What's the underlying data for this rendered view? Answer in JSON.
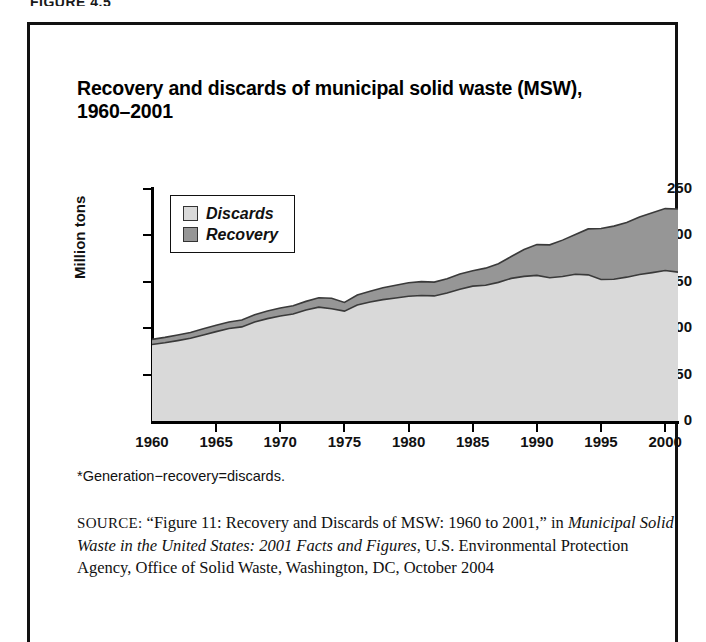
{
  "figure_label": "FIGURE 4.5",
  "title": "Recovery and discards of municipal solid waste (MSW), 1960–2001",
  "footnote": "*Generation−recovery=discards.",
  "source": {
    "prefix": "SOURCE:",
    "part1": "“Figure 11: Recovery and Discards of MSW: 1960 to 2001,” in ",
    "italic": "Municipal Solid Waste in the United States: 2001 Facts and Figures",
    "part2": ", U.S. Environmental Protection Agency, Office of Solid Waste, Washington, DC, October 2004"
  },
  "legend": {
    "items": [
      {
        "label": "Discards",
        "color": "#d9d9d9"
      },
      {
        "label": "Recovery",
        "color": "#969696"
      }
    ]
  },
  "colors": {
    "discards": "#d9d9d9",
    "recovery": "#969696",
    "outline": "#3a3a3a",
    "axis": "#000000",
    "frame": "#111111"
  },
  "chart_data": {
    "type": "area",
    "title": "Recovery and discards of municipal solid waste (MSW), 1960–2001",
    "xlabel": "",
    "ylabel": "Million tons",
    "xlim": [
      1960,
      2001
    ],
    "ylim": [
      0,
      250
    ],
    "grid": false,
    "legend_position": "inside-top-left",
    "stacked": true,
    "ytick_labels": [
      "0",
      "50",
      "100",
      "150",
      "200",
      "250"
    ],
    "yticks": [
      0,
      50,
      100,
      150,
      200,
      250
    ],
    "xtick_labels": [
      "1960",
      "1965",
      "1970",
      "1975",
      "1980",
      "1985",
      "1990",
      "1995",
      "2000"
    ],
    "xticks": [
      1960,
      1965,
      1970,
      1975,
      1980,
      1985,
      1990,
      1995,
      2000
    ],
    "x": [
      1960,
      1961,
      1962,
      1963,
      1964,
      1965,
      1966,
      1967,
      1968,
      1969,
      1970,
      1971,
      1972,
      1973,
      1974,
      1975,
      1976,
      1977,
      1978,
      1979,
      1980,
      1981,
      1982,
      1983,
      1984,
      1985,
      1986,
      1987,
      1988,
      1989,
      1990,
      1991,
      1992,
      1993,
      1994,
      1995,
      1996,
      1997,
      1998,
      1999,
      2000,
      2001
    ],
    "series": [
      {
        "name": "Discards",
        "color": "#d9d9d9",
        "values": [
          82.4,
          84.3,
          86.6,
          89.1,
          92.7,
          96.3,
          99.6,
          101.4,
          106.8,
          110.3,
          113.1,
          115.3,
          119.6,
          122.7,
          120.9,
          118.4,
          124.9,
          128.2,
          130.8,
          132.6,
          134.4,
          135.3,
          134.8,
          138.0,
          142.0,
          145.3,
          146.2,
          149.4,
          153.7,
          155.8,
          156.9,
          154.4,
          155.7,
          158.2,
          157.5,
          152.5,
          152.7,
          155.0,
          157.9,
          159.9,
          162.2,
          160.4
        ]
      },
      {
        "name": "Recovery",
        "color": "#969696",
        "values": [
          5.6,
          5.8,
          6.0,
          6.3,
          6.6,
          6.8,
          7.1,
          7.4,
          7.8,
          8.2,
          8.6,
          8.8,
          9.3,
          10.1,
          11.3,
          9.3,
          10.8,
          11.7,
          12.7,
          13.6,
          14.5,
          14.9,
          14.9,
          15.3,
          16.3,
          16.7,
          18.5,
          20.1,
          23.5,
          29.0,
          33.2,
          35.4,
          39.2,
          42.7,
          49.5,
          54.9,
          57.3,
          58.8,
          62.0,
          64.4,
          66.7,
          68.0
        ]
      }
    ],
    "totals": [
      88.0,
      90.1,
      92.6,
      95.4,
      99.3,
      103.1,
      106.7,
      108.8,
      114.6,
      118.5,
      121.7,
      124.1,
      128.9,
      132.8,
      132.2,
      127.7,
      135.7,
      139.9,
      143.5,
      146.2,
      148.9,
      150.2,
      149.7,
      153.3,
      158.3,
      162.0,
      164.7,
      169.5,
      177.2,
      184.8,
      190.1,
      189.8,
      194.9,
      200.9,
      207.0,
      207.4,
      210.0,
      213.8,
      219.9,
      224.3,
      228.9,
      228.4
    ]
  }
}
